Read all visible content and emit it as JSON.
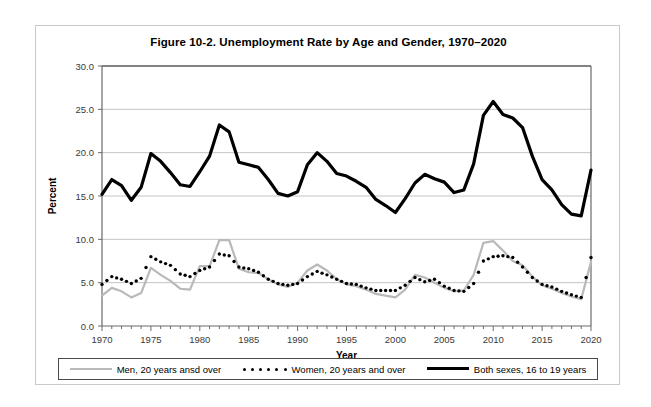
{
  "chart_data": {
    "type": "line",
    "title": "Figure 10-2. Unemployment Rate by Age and Gender, 1970–2020",
    "xlabel": "Year",
    "ylabel": "Percent",
    "xlim": [
      1970,
      2020
    ],
    "ylim": [
      0.0,
      30.0
    ],
    "ytick_step": 5.0,
    "xtick_step": 5,
    "grid": "horizontal",
    "legend_position": "bottom",
    "yticks": [
      "0.0",
      "5.0",
      "10.0",
      "15.0",
      "20.0",
      "25.0",
      "30.0"
    ],
    "xticks": [
      "1970",
      "1975",
      "1980",
      "1985",
      "1990",
      "1995",
      "2000",
      "2005",
      "2010",
      "2015",
      "2020"
    ],
    "x": [
      1970,
      1971,
      1972,
      1973,
      1974,
      1975,
      1976,
      1977,
      1978,
      1979,
      1980,
      1981,
      1982,
      1983,
      1984,
      1985,
      1986,
      1987,
      1988,
      1989,
      1990,
      1991,
      1992,
      1993,
      1994,
      1995,
      1996,
      1997,
      1998,
      1999,
      2000,
      2001,
      2002,
      2003,
      2004,
      2005,
      2006,
      2007,
      2008,
      2009,
      2010,
      2011,
      2012,
      2013,
      2014,
      2015,
      2016,
      2017,
      2018,
      2019,
      2020
    ],
    "series": [
      {
        "name": "Men, 20 years ansd over",
        "style": "solid",
        "color": "#b9b9b9",
        "width": 2.2,
        "values": [
          3.5,
          4.4,
          4.0,
          3.3,
          3.8,
          6.7,
          5.9,
          5.2,
          4.3,
          4.2,
          6.9,
          6.9,
          9.9,
          9.9,
          6.6,
          6.2,
          6.1,
          5.4,
          4.8,
          4.5,
          5.0,
          6.4,
          7.1,
          6.4,
          5.4,
          4.8,
          4.6,
          4.2,
          3.7,
          3.5,
          3.3,
          4.2,
          5.9,
          5.6,
          5.0,
          4.4,
          4.0,
          4.1,
          5.9,
          9.6,
          9.8,
          8.7,
          7.5,
          7.0,
          5.7,
          4.7,
          4.3,
          3.8,
          3.4,
          3.1,
          7.4
        ]
      },
      {
        "name": "Women, 20 years and over",
        "style": "dotted",
        "color": "#000000",
        "width": 2.2,
        "values": [
          4.8,
          5.7,
          5.4,
          4.9,
          5.5,
          8.0,
          7.4,
          7.0,
          6.0,
          5.7,
          6.4,
          6.8,
          8.3,
          8.1,
          6.8,
          6.6,
          6.2,
          5.4,
          4.9,
          4.7,
          4.9,
          5.7,
          6.3,
          5.9,
          5.4,
          4.9,
          4.8,
          4.4,
          4.1,
          4.1,
          4.1,
          4.7,
          5.6,
          5.1,
          5.4,
          4.6,
          4.1,
          4.0,
          4.9,
          7.5,
          8.0,
          8.1,
          7.9,
          6.8,
          5.6,
          4.8,
          4.5,
          4.0,
          3.6,
          3.3,
          7.9
        ]
      },
      {
        "name": "Both sexes, 16 to 19 years",
        "style": "solid",
        "color": "#000000",
        "width": 3.2,
        "values": [
          15.2,
          16.9,
          16.2,
          14.5,
          16.0,
          19.9,
          19.0,
          17.7,
          16.3,
          16.1,
          17.8,
          19.6,
          23.2,
          22.4,
          18.9,
          18.6,
          18.3,
          16.9,
          15.3,
          15.0,
          15.5,
          18.6,
          20.0,
          19.0,
          17.6,
          17.3,
          16.7,
          16.0,
          14.6,
          13.9,
          13.1,
          14.7,
          16.5,
          17.5,
          17.0,
          16.6,
          15.4,
          15.7,
          18.7,
          24.3,
          25.9,
          24.4,
          24.0,
          22.9,
          19.6,
          16.9,
          15.7,
          14.0,
          12.9,
          12.7,
          18.0
        ]
      }
    ]
  },
  "legend": {
    "items": [
      {
        "label": "Men, 20 years ansd over",
        "swatch": "solid-gray"
      },
      {
        "label": "Women, 20 years and over",
        "swatch": "dotted-black"
      },
      {
        "label": "Both sexes, 16 to 19 years",
        "swatch": "solid-black"
      }
    ]
  }
}
